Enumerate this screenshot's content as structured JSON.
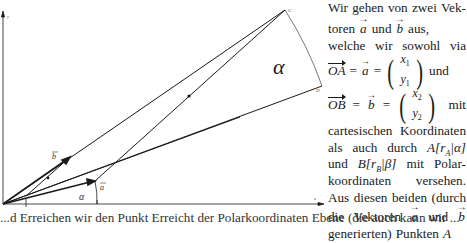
{
  "figure": {
    "axis_labels": {
      "x": "x",
      "y": "y"
    },
    "point_labels": {
      "C": "C",
      "D": "D"
    },
    "angle_label": "α",
    "angle_label_small": "α",
    "vector_labels": {
      "a": "a",
      "b": "b"
    },
    "colors": {
      "stroke": "#1a1a1a",
      "arc": "#555555"
    }
  },
  "text": {
    "lines": [
      [
        "Wir",
        "gehen",
        "von",
        "zwei",
        "Vek-"
      ],
      [
        "toren",
        "a",
        "und",
        "b",
        "aus,"
      ],
      [
        "welche",
        "wir",
        "sowohl",
        "via"
      ]
    ],
    "eq_a": {
      "lhs": "OA",
      "eq1": "=",
      "vec": "a",
      "eq2": "=",
      "top": "x",
      "top_sub": "1",
      "bot": "y",
      "bot_sub": "1",
      "tail": "und"
    },
    "eq_b": {
      "lhs": "OB",
      "eq1": "=",
      "vec": "b",
      "eq2": "=",
      "top": "x",
      "top_sub": "2",
      "bot": "y",
      "bot_sub": "2",
      "tail": "mit"
    },
    "line_cart": [
      "cartesischen",
      "Koordinaten"
    ],
    "line_polar_a": {
      "w1": "als",
      "w2": "auch",
      "w3": "durch",
      "A": "A",
      "rA": "r",
      "rA_sub": "A",
      "alpha": "α"
    },
    "line_polar_b": {
      "w1": "und",
      "B": "B",
      "rB": "r",
      "rB_sub": "B",
      "beta": "β",
      "w2": "mit",
      "w3": "Polar-"
    },
    "line_koord": [
      "koordinaten",
      "versehen."
    ],
    "line_aus": [
      "Aus",
      "diesen",
      "beiden",
      "(durch"
    ],
    "line_die": {
      "w1": "die",
      "w2": "Vektoren",
      "a": "a",
      "w3": "und",
      "b": "b"
    },
    "line_gen": {
      "w1": "generierten)",
      "w2": "Punkten",
      "A": "A"
    }
  },
  "bottom_line": "...d Erreichen wir den Punkt Erreicht der Polarkoordinaten Ebene (die auch kann wir ..."
}
